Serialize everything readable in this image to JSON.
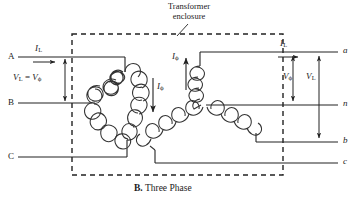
{
  "figure": {
    "caption_label": "B.",
    "caption_text": "Three Phase",
    "enclosure_note_line1": "Transformer",
    "enclosure_note_line2": "enclosure"
  },
  "primary_terminals": [
    {
      "name": "terminal-A",
      "label": "A",
      "y": 57
    },
    {
      "name": "terminal-B",
      "label": "B",
      "y": 103
    },
    {
      "name": "terminal-C",
      "label": "C",
      "y": 157
    }
  ],
  "secondary_terminals": [
    {
      "name": "terminal-a",
      "label": "a",
      "y": 52
    },
    {
      "name": "terminal-n",
      "label": "n",
      "y": 105
    },
    {
      "name": "terminal-b",
      "label": "b",
      "y": 142
    },
    {
      "name": "terminal-c",
      "label": "c",
      "y": 163
    }
  ],
  "annotations": {
    "primary_line_current": {
      "base": "I",
      "sub": "L"
    },
    "primary_voltage": {
      "text_prefix": "V",
      "sub1": "L",
      "equals": " = ",
      "text_suffix": "V",
      "sub2": "ϕ"
    },
    "primary_phase_current": {
      "base": "I",
      "sub": "ϕ"
    },
    "secondary_line_current": {
      "base": "I",
      "sub": "L"
    },
    "secondary_phase_current": {
      "base": "I",
      "sub": "ϕ"
    },
    "secondary_phase_voltage": {
      "base": "V",
      "sub": "ϕ"
    },
    "secondary_line_voltage": {
      "base": "V",
      "sub": "L"
    }
  },
  "colors": {
    "ink": "#1a1a1a",
    "wire": "#222222",
    "background": "#ffffff"
  }
}
